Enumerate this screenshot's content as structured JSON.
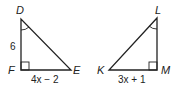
{
  "triangles": [
    {
      "name": "DFE",
      "vertices": {
        "top": "D",
        "right_angle": "F",
        "acute": "E"
      },
      "sides": {
        "DF": "6",
        "FE": "4x − 2"
      },
      "marked_angle": "D",
      "right_angle": "F"
    },
    {
      "name": "LMK",
      "vertices": {
        "top": "L",
        "right_angle": "M",
        "acute": "K"
      },
      "sides": {
        "KM": "3x + 1"
      },
      "marked_angle": "L",
      "right_angle": "M"
    }
  ],
  "colors": {
    "stroke": "#222222",
    "background": "#ffffff"
  }
}
